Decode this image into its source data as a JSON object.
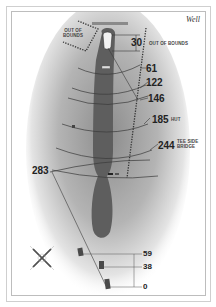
{
  "hole": {
    "title": "Well"
  },
  "hazards": {
    "out_of_bounds_left": "OUT OF BOUNDS",
    "out_of_bounds_right": "OUT OF BOUNDS"
  },
  "yardages": [
    {
      "value": "30",
      "note": ""
    },
    {
      "value": "61",
      "note": ""
    },
    {
      "value": "122",
      "note": ""
    },
    {
      "value": "146",
      "note": ""
    },
    {
      "value": "185",
      "note": "HUT"
    },
    {
      "value": "244",
      "note": "TEE SIDE BRIDGE"
    },
    {
      "value": "283",
      "note": ""
    }
  ],
  "tee_markers": [
    {
      "value": "59"
    },
    {
      "value": "38"
    },
    {
      "value": "0"
    }
  ],
  "compass": {
    "label": "compass rose"
  },
  "colors": {
    "fairway": "#5e5e5e",
    "rough_shade": "#9a9a9a",
    "background": "#ffffff",
    "text": "#222222"
  }
}
